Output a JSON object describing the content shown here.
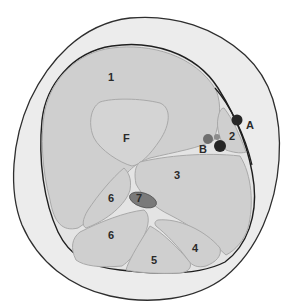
{
  "diagram": {
    "type": "anatomical-cross-section",
    "colors": {
      "background": "#ffffff",
      "skin": "#ececec",
      "skin_outline": "#2e2e2e",
      "fascia_outline": "#1f1f1f",
      "muscle_fill": "#cfcfcf",
      "muscle_outline": "#a9a9a9",
      "bone_fill": "#d4d4d4",
      "septum_fill": "#e6e6e6",
      "nerve_fill": "#7a7a7a",
      "vessel_dark": "#262626",
      "vessel_mid": "#6f6f6f",
      "vessel_light": "#8c8c8c"
    },
    "labels": [
      {
        "id": "1",
        "text": "1",
        "x": 111,
        "y": 78
      },
      {
        "id": "F",
        "text": "F",
        "x": 126,
        "y": 139
      },
      {
        "id": "2",
        "text": "2",
        "x": 232,
        "y": 138
      },
      {
        "id": "A",
        "text": "A",
        "x": 250,
        "y": 127
      },
      {
        "id": "B",
        "text": "B",
        "x": 203,
        "y": 151
      },
      {
        "id": "3",
        "text": "3",
        "x": 177,
        "y": 176
      },
      {
        "id": "6a",
        "text": "6",
        "x": 112,
        "y": 201
      },
      {
        "id": "7",
        "text": "7",
        "x": 140,
        "y": 200
      },
      {
        "id": "6b",
        "text": "6",
        "x": 112,
        "y": 238
      },
      {
        "id": "4",
        "text": "4",
        "x": 196,
        "y": 251
      },
      {
        "id": "5",
        "text": "5",
        "x": 155,
        "y": 263
      }
    ]
  }
}
